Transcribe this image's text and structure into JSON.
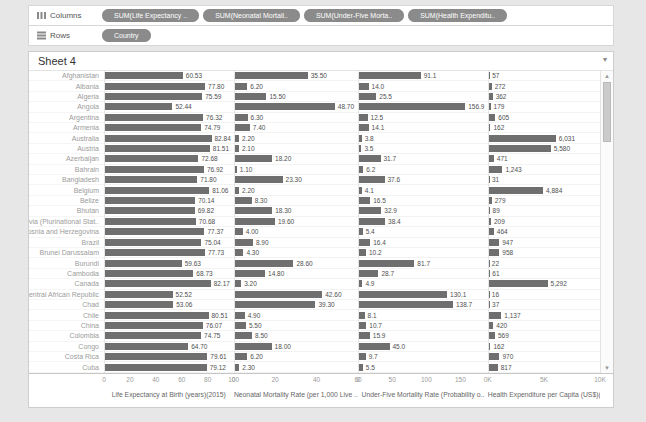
{
  "shelves": {
    "columns_label": "Columns",
    "rows_label": "Rows",
    "column_pills": [
      "SUM(Life Expectancy ..",
      "SUM(Neonatal Mortali..",
      "SUM(Under-Five Morta..",
      "SUM(Health Expenditu.."
    ],
    "row_pills": [
      "Country"
    ]
  },
  "sheet": {
    "title": "Sheet 4"
  },
  "chart_data": {
    "type": "bar",
    "orientation": "horizontal",
    "row_dimension": "Country",
    "legend": "none",
    "categories": [
      "Afghanistan",
      "Albania",
      "Algeria",
      "Angola",
      "Argentina",
      "Armenia",
      "Australia",
      "Austria",
      "Azerbaijan",
      "Bahrain",
      "Bangladesh",
      "Belgium",
      "Belize",
      "Bhutan",
      "Bolivia (Plurinational Stat..",
      "Bosnia and Herzegovina",
      "Brazil",
      "Brunei Darussalam",
      "Burundi",
      "Cambodia",
      "Canada",
      "Central African Republic",
      "Chad",
      "Chile",
      "China",
      "Colombia",
      "Congo",
      "Costa Rica",
      "Cuba"
    ],
    "series": [
      {
        "name": "Life Expectancy at Birth (years)(2015)",
        "axis_title": "Life Expectancy at Birth (years)(2015)",
        "scale_max": 100,
        "tick_labels": [
          "0",
          "20",
          "40",
          "60",
          "80",
          "100"
        ],
        "tick_values": [
          0,
          20,
          40,
          60,
          80,
          100
        ],
        "values": [
          60.53,
          77.8,
          75.59,
          52.44,
          76.32,
          74.79,
          82.84,
          81.51,
          72.68,
          76.92,
          71.8,
          81.06,
          70.14,
          69.82,
          70.68,
          77.37,
          75.04,
          77.73,
          59.63,
          68.73,
          82.17,
          52.52,
          53.06,
          80.51,
          76.07,
          74.75,
          64.7,
          79.61,
          79.12
        ],
        "labels": [
          "60.53",
          "77.80",
          "75.59",
          "52.44",
          "76.32",
          "74.79",
          "82.84",
          "81.51",
          "72.68",
          "76.92",
          "71.80",
          "81.06",
          "70.14",
          "69.82",
          "70.68",
          "77.37",
          "75.04",
          "77.73",
          "59.63",
          "68.73",
          "82.17",
          "52.52",
          "53.06",
          "80.51",
          "76.07",
          "74.75",
          "64.70",
          "79.61",
          "79.12"
        ]
      },
      {
        "name": "Neonatal Mortality Rate (per 1,000 Live Births)",
        "axis_title": "Neonatal Mortality Rate (per 1,000 Live ..",
        "scale_max": 60,
        "tick_labels": [
          "0",
          "20",
          "40",
          "60"
        ],
        "tick_values": [
          0,
          20,
          40,
          60
        ],
        "values": [
          35.5,
          6.2,
          15.5,
          48.7,
          6.3,
          7.4,
          2.2,
          2.1,
          18.2,
          1.1,
          23.3,
          2.2,
          8.3,
          18.3,
          19.6,
          4.0,
          8.9,
          4.3,
          28.6,
          14.8,
          3.2,
          42.6,
          39.3,
          4.9,
          5.5,
          8.5,
          18.0,
          6.2,
          2.3
        ],
        "labels": [
          "35.50",
          "6.20",
          "15.50",
          "48.70",
          "6.30",
          "7.40",
          "2.20",
          "2.10",
          "18.20",
          "1.10",
          "23.30",
          "2.20",
          "8.30",
          "18.30",
          "19.60",
          "4.00",
          "8.90",
          "4.30",
          "28.60",
          "14.80",
          "3.20",
          "42.60",
          "39.30",
          "4.90",
          "5.50",
          "8.50",
          "18.00",
          "6.20",
          "2.30"
        ]
      },
      {
        "name": "Under-Five Mortality Rate (Probability of dying by age 5)",
        "axis_title": "Under-Five Mortality Rate (Probability o..",
        "scale_max": 190,
        "tick_labels": [
          "0",
          "50",
          "100",
          "150"
        ],
        "tick_values": [
          0,
          50,
          100,
          150
        ],
        "values": [
          91.1,
          14.0,
          25.5,
          156.9,
          12.5,
          14.1,
          3.8,
          3.5,
          31.7,
          6.2,
          37.6,
          4.1,
          16.5,
          32.9,
          38.4,
          5.4,
          16.4,
          10.2,
          81.7,
          28.7,
          4.9,
          130.1,
          138.7,
          8.1,
          10.7,
          15.9,
          45.0,
          9.7,
          5.5
        ],
        "labels": [
          "91.1",
          "14.0",
          "25.5",
          "156.9",
          "12.5",
          "14.1",
          "3.8",
          "3.5",
          "31.7",
          "6.2",
          "37.6",
          "4.1",
          "16.5",
          "32.9",
          "38.4",
          "5.4",
          "16.4",
          "10.2",
          "81.7",
          "28.7",
          "4.9",
          "130.1",
          "138.7",
          "8.1",
          "10.7",
          "15.9",
          "45.0",
          "9.7",
          "5.5"
        ]
      },
      {
        "name": "Health Expenditure per Capita (US$)(2014)",
        "axis_title": "Health Expenditure per Capita (US$)(20..",
        "scale_max": 10000,
        "tick_labels": [
          "0K",
          "5K",
          "10K"
        ],
        "tick_values": [
          0,
          5000,
          10000
        ],
        "values": [
          57,
          272,
          362,
          179,
          605,
          162,
          6031,
          5580,
          471,
          1243,
          31,
          4884,
          279,
          89,
          209,
          464,
          947,
          958,
          22,
          61,
          5292,
          16,
          37,
          1137,
          420,
          569,
          162,
          970,
          817
        ],
        "labels": [
          "57",
          "272",
          "362",
          "179",
          "605",
          "162",
          "6,031",
          "5,580",
          "471",
          "1,243",
          "31",
          "4,884",
          "279",
          "89",
          "209",
          "464",
          "947",
          "958",
          "22",
          "61",
          "5,292",
          "16",
          "37",
          "1,137",
          "420",
          "569",
          "162",
          "970",
          "817"
        ]
      }
    ]
  }
}
